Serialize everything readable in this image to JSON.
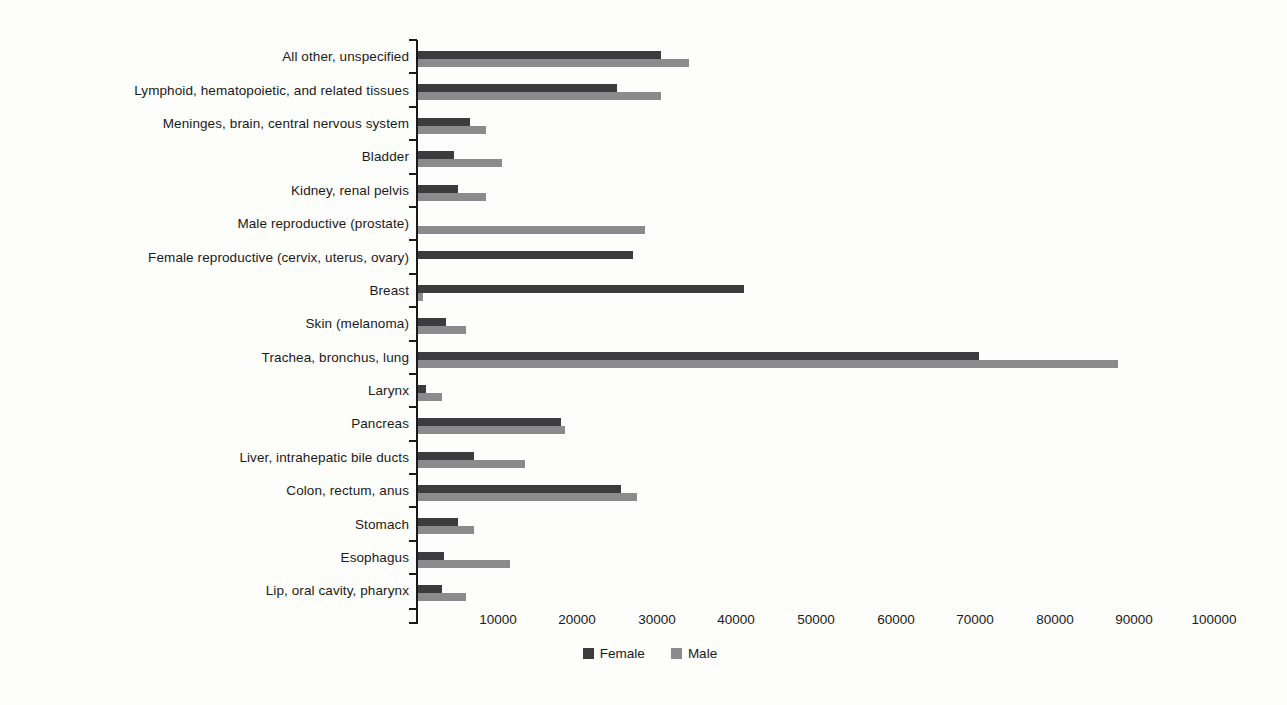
{
  "chart_data": {
    "type": "bar",
    "orientation": "horizontal",
    "title": "",
    "xlabel": "",
    "ylabel": "",
    "grid": false,
    "legend_position": "bottom-center",
    "xlim": [
      0,
      100500
    ],
    "x_ticks": [
      10000,
      20000,
      30000,
      40000,
      50000,
      60000,
      70000,
      80000,
      90000,
      100000
    ],
    "categories": [
      "All other, unspecified",
      "Lymphoid, hematopoietic, and related tissues",
      "Meninges, brain, central nervous system",
      "Bladder",
      "Kidney, renal pelvis",
      "Male reproductive (prostate)",
      "Female reproductive (cervix, uterus, ovary)",
      "Breast",
      "Skin (melanoma)",
      "Trachea, bronchus, lung",
      "Larynx",
      "Pancreas",
      "Liver, intrahepatic bile ducts",
      "Colon, rectum, anus",
      "Stomach",
      "Esophagus",
      "Lip, oral cavity, pharynx"
    ],
    "series": [
      {
        "name": "Female",
        "color": "#3c3c3e",
        "values": [
          30500,
          25000,
          6500,
          4500,
          5000,
          0,
          27000,
          41000,
          3500,
          70500,
          1000,
          18000,
          7000,
          25500,
          5000,
          3300,
          3000
        ]
      },
      {
        "name": "Male",
        "color": "#8b8b8e",
        "values": [
          34000,
          30500,
          8500,
          10500,
          8500,
          28500,
          0,
          600,
          6000,
          88000,
          3000,
          18500,
          13500,
          27500,
          7000,
          11500,
          6000
        ]
      }
    ]
  },
  "colors": {
    "axis": "#1a1a1a",
    "background": "#fdfdfc"
  }
}
